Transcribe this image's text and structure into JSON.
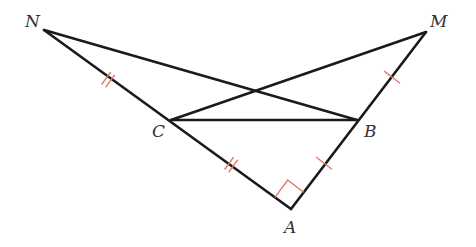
{
  "figure": {
    "type": "geometry-diagram",
    "points": {
      "N": {
        "label": "N",
        "x": 44,
        "y": 30,
        "label_x": 25,
        "label_y": 27
      },
      "M": {
        "label": "M",
        "x": 426,
        "y": 32,
        "label_x": 430,
        "label_y": 27
      },
      "C": {
        "label": "C",
        "x": 171,
        "y": 120,
        "label_x": 152,
        "label_y": 137
      },
      "B": {
        "label": "B",
        "x": 357,
        "y": 120,
        "label_x": 364,
        "label_y": 137
      },
      "A": {
        "label": "A",
        "x": 291,
        "y": 209,
        "label_x": 284,
        "label_y": 233
      }
    },
    "segments": [
      {
        "from": "N",
        "to": "B"
      },
      {
        "from": "N",
        "to": "A"
      },
      {
        "from": "M",
        "to": "C"
      },
      {
        "from": "M",
        "to": "A"
      },
      {
        "from": "C",
        "to": "B"
      }
    ],
    "marks": {
      "double_tick_NC": "NC",
      "double_tick_CA": "CA",
      "single_tick_MB": "MB",
      "single_tick_BA": "BA",
      "right_angle": "A"
    },
    "colors": {
      "line": "#1a1a1a",
      "mark": "#e07a6a",
      "label": "#333333"
    }
  }
}
